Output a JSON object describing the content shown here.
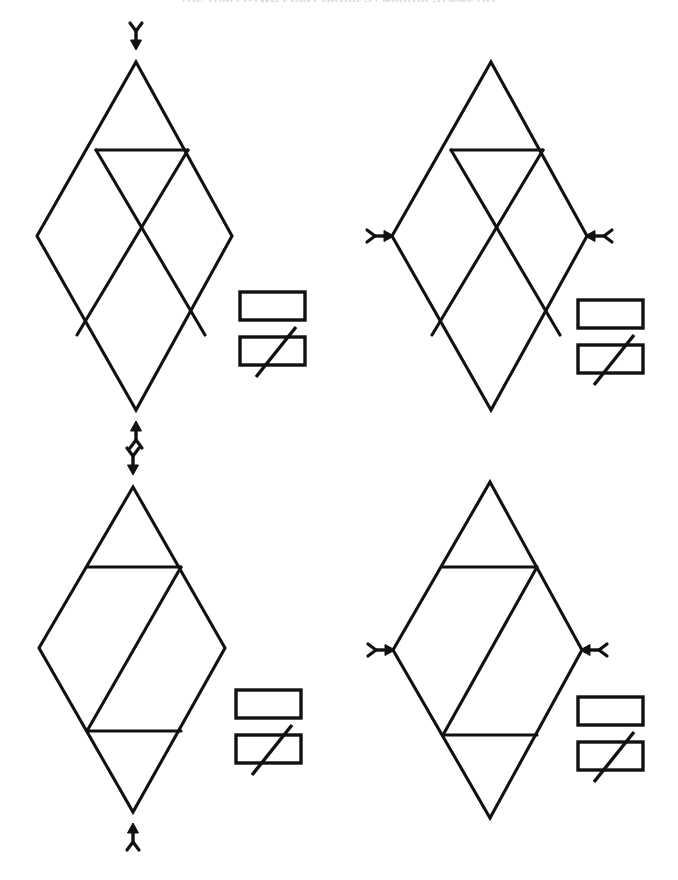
{
  "page": {
    "heading": "THE THIRTY-TWO POINT GROUPS / MIRROR SYMMETRY",
    "background_color": "#ffffff",
    "line_color": "#111111",
    "width": 678,
    "height": 880
  },
  "figure": {
    "type": "crystallographic-symmetry-diagram",
    "panel_count": 4,
    "panels": [
      {
        "id": "panel-top-left",
        "name": "rhombus-with-top-chord-and-double-diagonal",
        "position": "top-left",
        "rhombus": {
          "top": [
            136,
            62
          ],
          "right": [
            232,
            236
          ],
          "bottom": [
            136,
            410
          ],
          "left": [
            37,
            236
          ]
        },
        "internal_lines": [
          {
            "name": "upper-horizontal-chord",
            "from": [
              96,
              150
            ],
            "to": [
              188,
              150
            ]
          },
          {
            "name": "left-diagonal",
            "from": [
              96,
              150
            ],
            "to": [
              205,
              335
            ]
          },
          {
            "name": "right-diagonal",
            "from": [
              188,
              150
            ],
            "to": [
              77,
              335
            ]
          }
        ],
        "axis_markers": [
          {
            "name": "two-fold-axis-arrow-down",
            "orientation": "down",
            "at": [
              136,
              40
            ],
            "label": "2-fold axis"
          },
          {
            "name": "two-fold-axis-arrow-up",
            "orientation": "up",
            "at": [
              136,
              430
            ],
            "label": "2-fold axis"
          }
        ],
        "symbol_pair": {
          "name": "mirror-plane-symbol-pair",
          "plain_rect": [
            240,
            292,
            65,
            28
          ],
          "slashed_rect": [
            240,
            337,
            65,
            28
          ],
          "slash_direction": "lower-left-to-upper-right"
        }
      },
      {
        "id": "panel-top-right",
        "name": "rhombus-with-top-chord-and-double-diagonal-lateral-axes",
        "position": "top-right",
        "rhombus": {
          "top": [
            491,
            62
          ],
          "right": [
            587,
            236
          ],
          "bottom": [
            491,
            410
          ],
          "left": [
            392,
            236
          ]
        },
        "internal_lines": [
          {
            "name": "upper-horizontal-chord",
            "from": [
              451,
              150
            ],
            "to": [
              543,
              150
            ]
          },
          {
            "name": "left-diagonal",
            "from": [
              451,
              150
            ],
            "to": [
              560,
              335
            ]
          },
          {
            "name": "right-diagonal",
            "from": [
              543,
              150
            ],
            "to": [
              432,
              335
            ]
          }
        ],
        "axis_markers": [
          {
            "name": "two-fold-axis-arrow-right",
            "orientation": "right",
            "at": [
              370,
              236
            ],
            "label": "2-fold axis"
          },
          {
            "name": "two-fold-axis-arrow-left",
            "orientation": "left",
            "at": [
              609,
              236
            ],
            "label": "2-fold axis"
          }
        ],
        "symbol_pair": {
          "name": "mirror-plane-symbol-pair",
          "plain_rect": [
            578,
            300,
            65,
            28
          ],
          "slashed_rect": [
            578,
            345,
            65,
            28
          ],
          "slash_direction": "lower-left-to-upper-right"
        }
      },
      {
        "id": "panel-bottom-left",
        "name": "rhombus-with-two-chords-and-single-diagonal",
        "position": "bottom-left",
        "rhombus": {
          "top": [
            133,
            487
          ],
          "right": [
            225,
            648
          ],
          "bottom": [
            133,
            812
          ],
          "left": [
            39,
            648
          ]
        },
        "internal_lines": [
          {
            "name": "upper-horizontal-chord",
            "from": [
              87,
              567
            ],
            "to": [
              181,
              567
            ]
          },
          {
            "name": "lower-horizontal-chord",
            "from": [
              87,
              731
            ],
            "to": [
              181,
              731
            ]
          },
          {
            "name": "center-diagonal",
            "from": [
              87,
              731
            ],
            "to": [
              181,
              567
            ]
          }
        ],
        "axis_markers": [
          {
            "name": "two-fold-axis-arrow-down",
            "orientation": "down",
            "at": [
              133,
              466
            ],
            "label": "2-fold axis"
          },
          {
            "name": "two-fold-axis-arrow-up",
            "orientation": "up",
            "at": [
              133,
              832
            ],
            "label": "2-fold axis"
          }
        ],
        "symbol_pair": {
          "name": "mirror-plane-symbol-pair",
          "plain_rect": [
            236,
            690,
            65,
            28
          ],
          "slashed_rect": [
            236,
            735,
            65,
            28
          ],
          "slash_direction": "lower-left-to-upper-right"
        }
      },
      {
        "id": "panel-bottom-right",
        "name": "rhombus-with-two-chords-and-single-diagonal-lateral-axes",
        "position": "bottom-right",
        "rhombus": {
          "top": [
            490,
            482
          ],
          "right": [
            582,
            650
          ],
          "bottom": [
            490,
            818
          ],
          "left": [
            393,
            650
          ]
        },
        "internal_lines": [
          {
            "name": "upper-horizontal-chord",
            "from": [
              443,
              567
            ],
            "to": [
              537,
              567
            ]
          },
          {
            "name": "lower-horizontal-chord",
            "from": [
              443,
              735
            ],
            "to": [
              537,
              735
            ]
          },
          {
            "name": "center-diagonal",
            "from": [
              443,
              735
            ],
            "to": [
              537,
              567
            ]
          }
        ],
        "axis_markers": [
          {
            "name": "two-fold-axis-arrow-right",
            "orientation": "right",
            "at": [
              371,
              650
            ],
            "label": "2-fold axis"
          },
          {
            "name": "two-fold-axis-arrow-left",
            "orientation": "left",
            "at": [
              604,
              650
            ],
            "label": "2-fold axis"
          }
        ],
        "symbol_pair": {
          "name": "mirror-plane-symbol-pair",
          "plain_rect": [
            578,
            697,
            65,
            28
          ],
          "slashed_rect": [
            578,
            742,
            65,
            28
          ],
          "slash_direction": "lower-left-to-upper-right"
        }
      }
    ]
  }
}
